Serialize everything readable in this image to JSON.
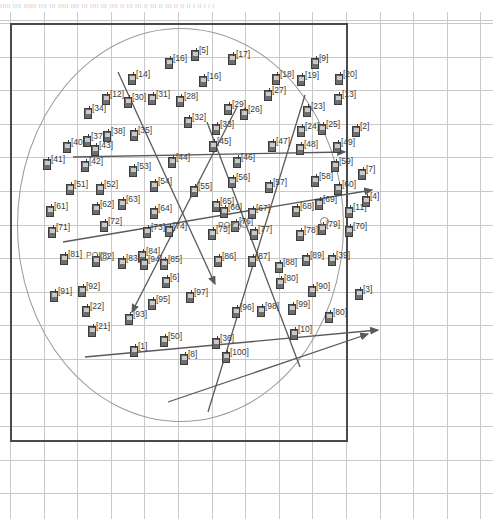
{
  "header": {
    "caption_strip": "ııııı ıııı ıııııı ıııı ııı ııııı ıııı ııı ıııı ııı ıııı ıı ııı ııı ıı ııı ıı ııı ıı ıı ıı ı ıı ı ı ı"
  },
  "colors": {
    "node_fill": "#6d6d6d",
    "node_stroke": "#3c3c3c",
    "grid": "#c9c9c9",
    "frame": "#4a4a4a",
    "circle": "#9a9a9a",
    "link": "#5a5a5a",
    "label": "#3a3a3a",
    "background": "#ffffff"
  },
  "scene": {
    "type": "wireless-network-topology",
    "frame": {
      "x": 10,
      "y": 11,
      "width": 338,
      "height": 419
    },
    "coverage_circle": {
      "cx": 180,
      "cy": 212,
      "rx": 163,
      "ry": 196
    },
    "grid_spacing_px": 33.6,
    "node_count": 100,
    "poi_count": 4,
    "link_count": 8
  },
  "poi": [
    {
      "label": "POI",
      "x": 100,
      "y": 240
    },
    {
      "label": "POI",
      "x": 232,
      "y": 210
    },
    {
      "label": "",
      "x": 240,
      "y": 207
    },
    {
      "label": "",
      "x": 320,
      "y": 205
    }
  ],
  "links": [
    {
      "from": [
        118,
        60
      ],
      "to": [
        215,
        272
      ],
      "arrow": true
    },
    {
      "from": [
        237,
        95
      ],
      "to": [
        132,
        300
      ],
      "arrow": true
    },
    {
      "from": [
        305,
        83
      ],
      "to": [
        208,
        400
      ],
      "arrow": false
    },
    {
      "from": [
        73,
        145
      ],
      "to": [
        345,
        140
      ],
      "arrow": true
    },
    {
      "from": [
        63,
        230
      ],
      "to": [
        372,
        178
      ],
      "arrow": true
    },
    {
      "from": [
        85,
        345
      ],
      "to": [
        378,
        318
      ],
      "arrow": true
    },
    {
      "from": [
        168,
        390
      ],
      "to": [
        368,
        322
      ],
      "arrow": true
    },
    {
      "from": [
        207,
        110
      ],
      "to": [
        300,
        355
      ],
      "arrow": false
    }
  ],
  "nodes": [
    {
      "id": "[5]",
      "x": 191,
      "y": 36,
      "lx": 199,
      "ly": 34
    },
    {
      "id": "[17]",
      "x": 228,
      "y": 40,
      "lx": 236,
      "ly": 38
    },
    {
      "id": "[16]",
      "x": 165,
      "y": 44,
      "lx": 173,
      "ly": 42
    },
    {
      "id": "[9]",
      "x": 311,
      "y": 44,
      "lx": 319,
      "ly": 42
    },
    {
      "id": "[14]",
      "x": 128,
      "y": 60,
      "lx": 136,
      "ly": 58
    },
    {
      "id": "[18]",
      "x": 272,
      "y": 60,
      "lx": 280,
      "ly": 58
    },
    {
      "id": "[19]",
      "x": 297,
      "y": 61,
      "lx": 305,
      "ly": 59
    },
    {
      "id": "[20]",
      "x": 335,
      "y": 60,
      "lx": 343,
      "ly": 58
    },
    {
      "id": "[16b]",
      "x": 199,
      "y": 62,
      "lx": 207,
      "ly": 60,
      "text": "[16]"
    },
    {
      "id": "[12]",
      "x": 102,
      "y": 80,
      "lx": 110,
      "ly": 78
    },
    {
      "id": "[30]",
      "x": 124,
      "y": 83,
      "lx": 132,
      "ly": 81
    },
    {
      "id": "[31]",
      "x": 148,
      "y": 80,
      "lx": 156,
      "ly": 78
    },
    {
      "id": "[28]",
      "x": 176,
      "y": 82,
      "lx": 184,
      "ly": 80
    },
    {
      "id": "[27]",
      "x": 264,
      "y": 76,
      "lx": 272,
      "ly": 74
    },
    {
      "id": "[13]",
      "x": 334,
      "y": 80,
      "lx": 342,
      "ly": 78
    },
    {
      "id": "[29]",
      "x": 224,
      "y": 90,
      "lx": 232,
      "ly": 88
    },
    {
      "id": "[26]",
      "x": 240,
      "y": 95,
      "lx": 248,
      "ly": 93
    },
    {
      "id": "[23]",
      "x": 303,
      "y": 92,
      "lx": 311,
      "ly": 90
    },
    {
      "id": "[34]",
      "x": 84,
      "y": 94,
      "lx": 92,
      "ly": 92
    },
    {
      "id": "[32]",
      "x": 184,
      "y": 103,
      "lx": 192,
      "ly": 101
    },
    {
      "id": "[33]",
      "x": 212,
      "y": 110,
      "lx": 220,
      "ly": 108
    },
    {
      "id": "[24]",
      "x": 297,
      "y": 112,
      "lx": 305,
      "ly": 110
    },
    {
      "id": "[25]",
      "x": 318,
      "y": 110,
      "lx": 326,
      "ly": 108
    },
    {
      "id": "[2]",
      "x": 352,
      "y": 112,
      "lx": 360,
      "ly": 110
    },
    {
      "id": "[38]",
      "x": 103,
      "y": 117,
      "lx": 111,
      "ly": 115
    },
    {
      "id": "[35]",
      "x": 130,
      "y": 116,
      "lx": 138,
      "ly": 114
    },
    {
      "id": "[37]",
      "x": 83,
      "y": 122,
      "lx": 91,
      "ly": 120
    },
    {
      "id": "[40]",
      "x": 63,
      "y": 128,
      "lx": 71,
      "ly": 126
    },
    {
      "id": "[43]",
      "x": 91,
      "y": 131,
      "lx": 99,
      "ly": 129
    },
    {
      "id": "[45]",
      "x": 209,
      "y": 127,
      "lx": 217,
      "ly": 125
    },
    {
      "id": "[47]",
      "x": 268,
      "y": 127,
      "lx": 276,
      "ly": 125
    },
    {
      "id": "[48]",
      "x": 296,
      "y": 130,
      "lx": 304,
      "ly": 128
    },
    {
      "id": "[49]",
      "x": 333,
      "y": 128,
      "lx": 341,
      "ly": 126
    },
    {
      "id": "[41]",
      "x": 43,
      "y": 145,
      "lx": 51,
      "ly": 143
    },
    {
      "id": "[42]",
      "x": 81,
      "y": 147,
      "lx": 89,
      "ly": 145
    },
    {
      "id": "[44]",
      "x": 168,
      "y": 143,
      "lx": 176,
      "ly": 141
    },
    {
      "id": "[46]",
      "x": 233,
      "y": 143,
      "lx": 241,
      "ly": 141
    },
    {
      "id": "[59]",
      "x": 331,
      "y": 147,
      "lx": 339,
      "ly": 145
    },
    {
      "id": "[53]",
      "x": 129,
      "y": 152,
      "lx": 137,
      "ly": 150
    },
    {
      "id": "[7]",
      "x": 358,
      "y": 155,
      "lx": 366,
      "ly": 153
    },
    {
      "id": "[51]",
      "x": 66,
      "y": 170,
      "lx": 74,
      "ly": 168
    },
    {
      "id": "[52]",
      "x": 96,
      "y": 170,
      "lx": 104,
      "ly": 168
    },
    {
      "id": "[54]",
      "x": 150,
      "y": 167,
      "lx": 158,
      "ly": 165
    },
    {
      "id": "[55]",
      "x": 190,
      "y": 172,
      "lx": 198,
      "ly": 170
    },
    {
      "id": "[56]",
      "x": 228,
      "y": 163,
      "lx": 236,
      "ly": 161
    },
    {
      "id": "[57]",
      "x": 265,
      "y": 168,
      "lx": 273,
      "ly": 166
    },
    {
      "id": "[58]",
      "x": 311,
      "y": 162,
      "lx": 319,
      "ly": 160
    },
    {
      "id": "[60]",
      "x": 334,
      "y": 170,
      "lx": 342,
      "ly": 168
    },
    {
      "id": "[61]",
      "x": 46,
      "y": 192,
      "lx": 54,
      "ly": 190
    },
    {
      "id": "[62]",
      "x": 92,
      "y": 190,
      "lx": 100,
      "ly": 188
    },
    {
      "id": "[63]",
      "x": 118,
      "y": 185,
      "lx": 126,
      "ly": 183
    },
    {
      "id": "[64]",
      "x": 150,
      "y": 194,
      "lx": 158,
      "ly": 192
    },
    {
      "id": "[65]",
      "x": 212,
      "y": 187,
      "lx": 220,
      "ly": 185
    },
    {
      "id": "[66]",
      "x": 220,
      "y": 193,
      "lx": 228,
      "ly": 191
    },
    {
      "id": "[67]",
      "x": 248,
      "y": 194,
      "lx": 256,
      "ly": 192
    },
    {
      "id": "[68]",
      "x": 292,
      "y": 192,
      "lx": 300,
      "ly": 190
    },
    {
      "id": "[69]",
      "x": 315,
      "y": 185,
      "lx": 323,
      "ly": 183
    },
    {
      "id": "[11]",
      "x": 345,
      "y": 193,
      "lx": 353,
      "ly": 191
    },
    {
      "id": "[4]",
      "x": 362,
      "y": 182,
      "lx": 370,
      "ly": 180
    },
    {
      "id": "[71]",
      "x": 48,
      "y": 213,
      "lx": 56,
      "ly": 211
    },
    {
      "id": "[72]",
      "x": 100,
      "y": 207,
      "lx": 108,
      "ly": 205
    },
    {
      "id": "[73]",
      "x": 143,
      "y": 213,
      "lx": 151,
      "ly": 211
    },
    {
      "id": "[74]",
      "x": 165,
      "y": 212,
      "lx": 173,
      "ly": 210
    },
    {
      "id": "[75]",
      "x": 208,
      "y": 215,
      "lx": 216,
      "ly": 213
    },
    {
      "id": "[76]",
      "x": 231,
      "y": 207,
      "lx": 239,
      "ly": 205
    },
    {
      "id": "[77]",
      "x": 250,
      "y": 215,
      "lx": 258,
      "ly": 213
    },
    {
      "id": "[78]",
      "x": 296,
      "y": 216,
      "lx": 304,
      "ly": 214
    },
    {
      "id": "[79]",
      "x": 318,
      "y": 210,
      "lx": 326,
      "ly": 208
    },
    {
      "id": "[70]",
      "x": 345,
      "y": 212,
      "lx": 353,
      "ly": 210
    },
    {
      "id": "[81]",
      "x": 60,
      "y": 240,
      "lx": 68,
      "ly": 238
    },
    {
      "id": "[82]",
      "x": 92,
      "y": 242,
      "lx": 100,
      "ly": 240
    },
    {
      "id": "[83]",
      "x": 118,
      "y": 244,
      "lx": 126,
      "ly": 242
    },
    {
      "id": "[84]",
      "x": 138,
      "y": 237,
      "lx": 146,
      "ly": 235
    },
    {
      "id": "[94]",
      "x": 140,
      "y": 245,
      "lx": 148,
      "ly": 243
    },
    {
      "id": "[85]",
      "x": 160,
      "y": 245,
      "lx": 168,
      "ly": 243
    },
    {
      "id": "[86]",
      "x": 214,
      "y": 242,
      "lx": 222,
      "ly": 240
    },
    {
      "id": "[87]",
      "x": 248,
      "y": 242,
      "lx": 256,
      "ly": 240
    },
    {
      "id": "[88]",
      "x": 275,
      "y": 248,
      "lx": 283,
      "ly": 246
    },
    {
      "id": "[89]",
      "x": 302,
      "y": 241,
      "lx": 310,
      "ly": 239
    },
    {
      "id": "[39]",
      "x": 328,
      "y": 241,
      "lx": 336,
      "ly": 239
    },
    {
      "id": "[91]",
      "x": 50,
      "y": 277,
      "lx": 58,
      "ly": 275
    },
    {
      "id": "[92]",
      "x": 78,
      "y": 272,
      "lx": 86,
      "ly": 270
    },
    {
      "id": "[6]",
      "x": 162,
      "y": 263,
      "lx": 170,
      "ly": 261
    },
    {
      "id": "[80b]",
      "x": 276,
      "y": 264,
      "lx": 284,
      "ly": 262,
      "text": "[80]"
    },
    {
      "id": "[90]",
      "x": 308,
      "y": 272,
      "lx": 316,
      "ly": 270
    },
    {
      "id": "[3]",
      "x": 355,
      "y": 275,
      "lx": 363,
      "ly": 273
    },
    {
      "id": "[95]",
      "x": 148,
      "y": 285,
      "lx": 156,
      "ly": 283
    },
    {
      "id": "[97]",
      "x": 186,
      "y": 278,
      "lx": 194,
      "ly": 276
    },
    {
      "id": "[22]",
      "x": 82,
      "y": 292,
      "lx": 90,
      "ly": 290
    },
    {
      "id": "[93]",
      "x": 125,
      "y": 300,
      "lx": 133,
      "ly": 298
    },
    {
      "id": "[96]",
      "x": 232,
      "y": 293,
      "lx": 240,
      "ly": 291
    },
    {
      "id": "[98]",
      "x": 257,
      "y": 292,
      "lx": 265,
      "ly": 290
    },
    {
      "id": "[99]",
      "x": 288,
      "y": 290,
      "lx": 296,
      "ly": 288
    },
    {
      "id": "[80]",
      "x": 325,
      "y": 298,
      "lx": 333,
      "ly": 296
    },
    {
      "id": "[21]",
      "x": 88,
      "y": 312,
      "lx": 96,
      "ly": 310
    },
    {
      "id": "[50]",
      "x": 160,
      "y": 322,
      "lx": 168,
      "ly": 320
    },
    {
      "id": "[1]",
      "x": 130,
      "y": 332,
      "lx": 138,
      "ly": 330
    },
    {
      "id": "[36]",
      "x": 212,
      "y": 324,
      "lx": 220,
      "ly": 322
    },
    {
      "id": "[10]",
      "x": 290,
      "y": 315,
      "lx": 298,
      "ly": 313
    },
    {
      "id": "[8]",
      "x": 180,
      "y": 340,
      "lx": 188,
      "ly": 338
    },
    {
      "id": "[100]",
      "x": 222,
      "y": 338,
      "lx": 230,
      "ly": 336
    }
  ]
}
